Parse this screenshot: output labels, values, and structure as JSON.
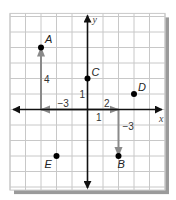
{
  "diagram": {
    "type": "coordinate-plane",
    "grid": {
      "x_min": -5,
      "x_max": 5,
      "y_min": -5.2,
      "y_max": 6.2,
      "cell_px": 15.5,
      "line_color": "#c8c8c8",
      "background": "#ffffff",
      "shadow_color": "#9a9a9a"
    },
    "axes": {
      "x_label": "x",
      "y_label": "y",
      "color": "#111111"
    },
    "points": [
      {
        "id": "A",
        "label": "A",
        "x": -3,
        "y": 4
      },
      {
        "id": "B",
        "label": "B",
        "x": 2,
        "y": -3
      },
      {
        "id": "C",
        "label": "C",
        "x": 0,
        "y": 2
      },
      {
        "id": "D",
        "label": "D",
        "x": 3,
        "y": 1
      },
      {
        "id": "E",
        "label": "E",
        "x": -2,
        "y": -3
      }
    ],
    "moves": [
      {
        "id": "A-horizontal",
        "from": [
          0,
          0
        ],
        "to": [
          -3,
          0
        ],
        "label": "−3"
      },
      {
        "id": "A-vertical",
        "from": [
          -3,
          0
        ],
        "to": [
          -3,
          4
        ],
        "label": "4"
      },
      {
        "id": "B-horizontal",
        "from": [
          0,
          0
        ],
        "to": [
          2,
          0
        ],
        "label": "2"
      },
      {
        "id": "B-vertical",
        "from": [
          2,
          0
        ],
        "to": [
          2,
          -3
        ],
        "label": "−3"
      }
    ],
    "scale_labels": [
      {
        "id": "y-unit",
        "text": "1"
      },
      {
        "id": "x-unit",
        "text": "1"
      }
    ],
    "move_color": "#8a8a8a"
  }
}
